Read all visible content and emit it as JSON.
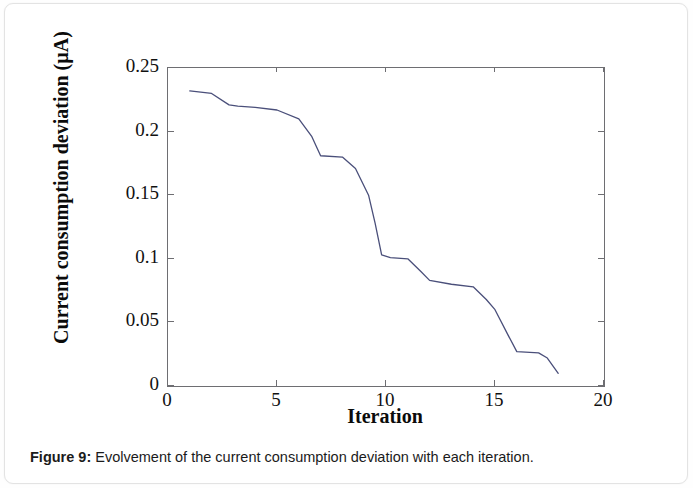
{
  "figure": {
    "caption_label": "Figure 9:",
    "caption_text": "Evolvement of the current consumption deviation with each iteration."
  },
  "chart_data": {
    "type": "line",
    "title": "",
    "subtitle": "",
    "xlabel": "Iteration",
    "ylabel": "Current consumption deviation (µA)",
    "xlim": [
      0,
      20
    ],
    "ylim": [
      0,
      0.25
    ],
    "xticks": [
      0,
      5,
      10,
      15,
      20
    ],
    "xtick_labels": [
      "0",
      "5",
      "10",
      "15",
      "20"
    ],
    "yticks": [
      0,
      0.05,
      0.1,
      0.15,
      0.2,
      0.25
    ],
    "ytick_labels": [
      "0",
      "0.05",
      "0.1",
      "0.15",
      "0.2",
      "0.25"
    ],
    "grid": false,
    "legend": null,
    "legend_position": "none",
    "line_color": "#4a4f7a",
    "line_width": 1.3,
    "axis_color": "#6e6e72",
    "series": [
      {
        "name": "Current consumption deviation",
        "x": [
          1.0,
          2.0,
          2.8,
          3.2,
          4.0,
          5.0,
          6.0,
          6.6,
          7.0,
          8.0,
          8.6,
          9.2,
          9.5,
          9.8,
          10.2,
          11.0,
          11.6,
          12.0,
          13.0,
          14.0,
          14.6,
          15.0,
          15.6,
          16.0,
          17.0,
          17.4,
          17.9
        ],
        "y": [
          0.232,
          0.23,
          0.221,
          0.22,
          0.219,
          0.217,
          0.21,
          0.196,
          0.181,
          0.18,
          0.171,
          0.15,
          0.128,
          0.103,
          0.101,
          0.1,
          0.09,
          0.083,
          0.08,
          0.078,
          0.068,
          0.06,
          0.04,
          0.027,
          0.026,
          0.022,
          0.01
        ]
      }
    ]
  }
}
